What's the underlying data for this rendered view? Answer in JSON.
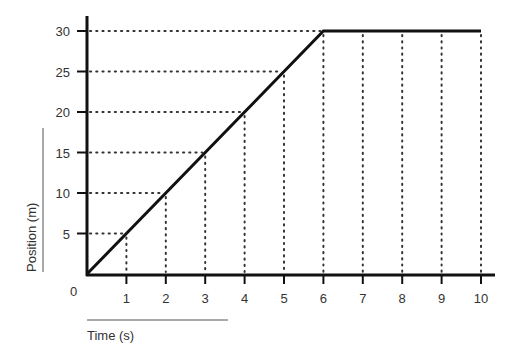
{
  "chart_data": {
    "type": "line",
    "title": "",
    "xlabel": "Time (s)",
    "ylabel": "Position (m)",
    "x": [
      0,
      1,
      2,
      3,
      4,
      5,
      6,
      7,
      8,
      9,
      10
    ],
    "series": [
      {
        "name": "Position",
        "values": [
          0,
          5,
          10,
          15,
          20,
          25,
          30,
          30,
          30,
          30,
          30
        ],
        "color": "#111111"
      }
    ],
    "xlim": [
      0,
      10
    ],
    "ylim": [
      0,
      30
    ],
    "x_ticks": [
      "1",
      "2",
      "3",
      "4",
      "5",
      "6",
      "7",
      "8",
      "9",
      "10"
    ],
    "y_ticks": [
      "5",
      "10",
      "15",
      "20",
      "25",
      "30"
    ],
    "origin_label": "0",
    "grid": "dotted guide lines from each data point to the axes",
    "legend": "none"
  },
  "labels": {
    "x_axis_title": "Time (s)",
    "y_axis_title": "Position (m)",
    "origin": "0"
  }
}
